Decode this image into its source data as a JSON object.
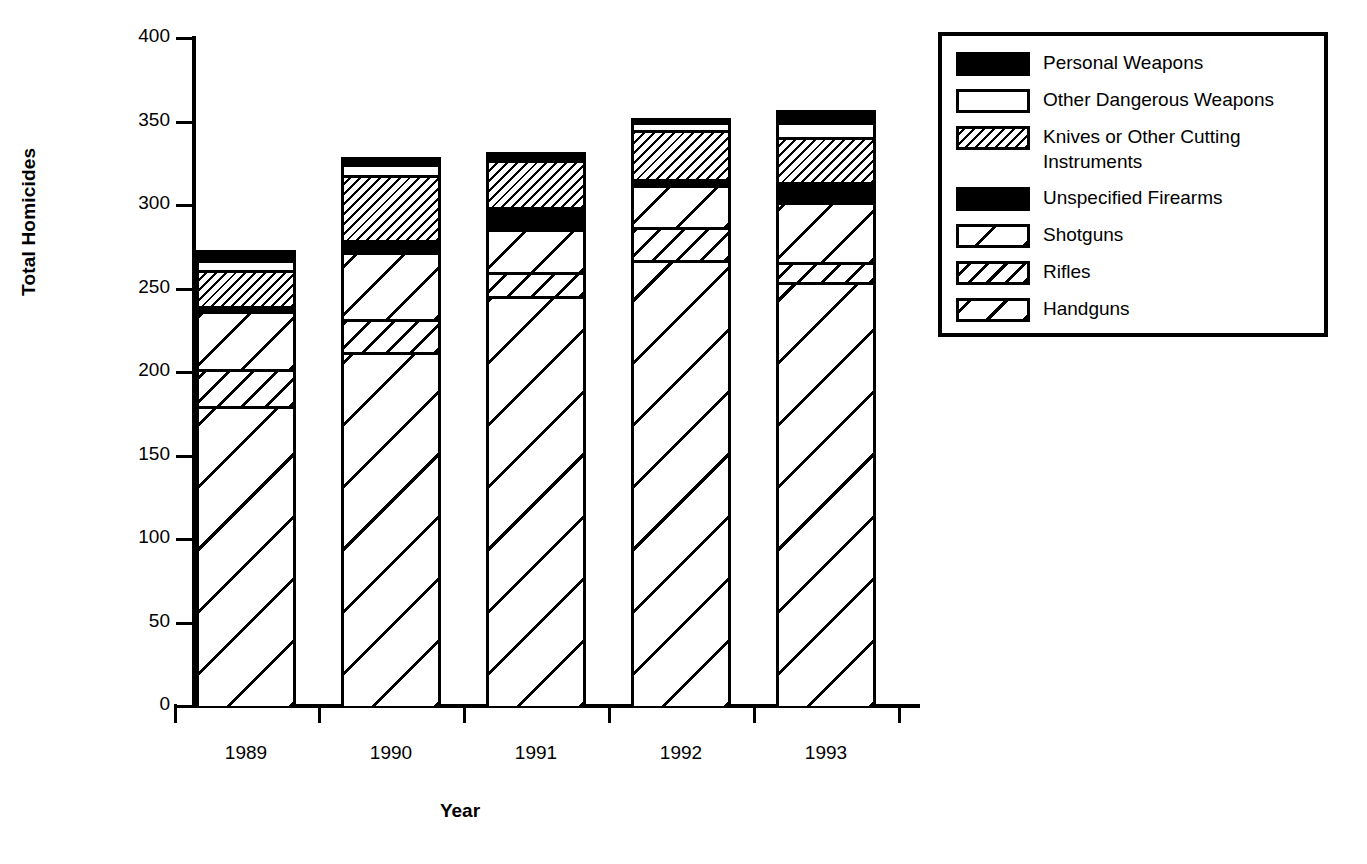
{
  "chart_data": {
    "type": "bar",
    "stacked": true,
    "title": "",
    "xlabel": "Year",
    "ylabel": "Total Homicides",
    "categories": [
      "1989",
      "1990",
      "1991",
      "1992",
      "1993"
    ],
    "ylim": [
      0,
      400
    ],
    "yticks": [
      0,
      50,
      100,
      150,
      200,
      250,
      300,
      350,
      400
    ],
    "ytick_labels": [
      "0",
      "50",
      "100",
      "150",
      "200",
      "250",
      "300",
      "350",
      "400"
    ],
    "grid": false,
    "legend_position": "right",
    "series": [
      {
        "name": "Handguns",
        "pattern": "diagonal-wide-hatch",
        "values": [
          178,
          210,
          244,
          265,
          252
        ]
      },
      {
        "name": "Rifles",
        "pattern": "diagonal-medium-hatch",
        "values": [
          22,
          20,
          14,
          20,
          12
        ]
      },
      {
        "name": "Shotguns",
        "pattern": "diagonal-sparse-hatch",
        "values": [
          35,
          40,
          26,
          25,
          36
        ]
      },
      {
        "name": "Unspecified Firearms",
        "pattern": "solid-black",
        "values": [
          3,
          7,
          13,
          4,
          12
        ]
      },
      {
        "name": "Knives or Other Cutting Instruments",
        "pattern": "diagonal-dense-hatch",
        "values": [
          21,
          39,
          28,
          29,
          27
        ]
      },
      {
        "name": "Other Dangerous Weapons",
        "pattern": "white",
        "values": [
          6,
          7,
          2,
          5,
          9
        ]
      },
      {
        "name": "Personal Weapons",
        "pattern": "solid-black",
        "values": [
          8,
          6,
          5,
          4,
          9
        ]
      }
    ],
    "totals": [
      273,
      329,
      332,
      352,
      357
    ],
    "cumulative": {
      "1989": {
        "handguns": 178,
        "rifles": 200,
        "shotguns": 235,
        "unspecified_firearms": 238,
        "knives": 259,
        "other_dangerous": 265,
        "personal": 273
      },
      "1990": {
        "handguns": 210,
        "rifles": 230,
        "shotguns": 270,
        "unspecified_firearms": 277,
        "knives": 316,
        "other_dangerous": 323,
        "personal": 329
      },
      "1991": {
        "handguns": 244,
        "rifles": 258,
        "shotguns": 284,
        "unspecified_firearms": 297,
        "knives": 325,
        "other_dangerous": 327,
        "personal": 332
      },
      "1992": {
        "handguns": 265,
        "rifles": 285,
        "shotguns": 310,
        "unspecified_firearms": 314,
        "knives": 343,
        "other_dangerous": 348,
        "personal": 352
      },
      "1993": {
        "handguns": 252,
        "rifles": 264,
        "shotguns": 300,
        "unspecified_firearms": 312,
        "knives": 339,
        "other_dangerous": 348,
        "personal": 357
      }
    }
  },
  "axes": {
    "ylabel": "Total Homicides",
    "xlabel": "Year",
    "ytick_labels": [
      "400",
      "350",
      "300",
      "250",
      "200",
      "150",
      "100",
      "50",
      "0"
    ],
    "xtick_labels": [
      "1989",
      "1990",
      "1991",
      "1992",
      "1993"
    ]
  },
  "legend": {
    "items": [
      {
        "label": "Personal Weapons",
        "label_line2": "",
        "swatch": "solid-black-swatch"
      },
      {
        "label": "Other Dangerous Weapons",
        "label_line2": "",
        "swatch": "white-swatch"
      },
      {
        "label": "Knives or Other Cutting",
        "label_line2": "Instruments",
        "swatch": "dense-hatch-swatch"
      },
      {
        "label": "Unspecified Firearms",
        "label_line2": "",
        "swatch": "solid-black-swatch"
      },
      {
        "label": "Shotguns",
        "label_line2": "",
        "swatch": "sparse-hatch-swatch"
      },
      {
        "label": "Rifles",
        "label_line2": "",
        "swatch": "medium-hatch-swatch"
      },
      {
        "label": "Handguns",
        "label_line2": "",
        "swatch": "wide-hatch-swatch"
      }
    ]
  },
  "colors": {
    "foreground": "#000000",
    "background": "#ffffff"
  }
}
